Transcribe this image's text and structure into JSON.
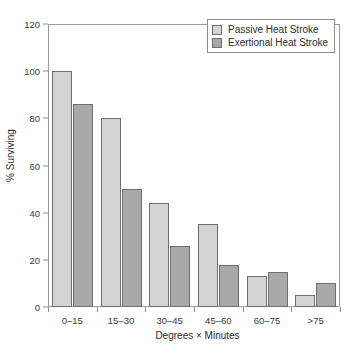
{
  "chart_data": {
    "type": "bar",
    "xlabel": "Degrees × Minutes",
    "ylabel": "% Surviving",
    "categories": [
      "0–15",
      "15–30",
      "30–45",
      "45–60",
      "60–75",
      ">75"
    ],
    "series": [
      {
        "name": "Passive Heat Stroke",
        "color": "#d4d4d4",
        "values": [
          100,
          80,
          44,
          35,
          13,
          5
        ]
      },
      {
        "name": "Exertional Heat Stroke",
        "color": "#a9a9a9",
        "values": [
          86,
          50,
          26,
          18,
          15,
          10
        ]
      }
    ],
    "ylim": [
      0,
      120
    ],
    "yticks": [
      0,
      20,
      40,
      60,
      80,
      100,
      120
    ],
    "grid": false,
    "legend_position": "top-right"
  }
}
